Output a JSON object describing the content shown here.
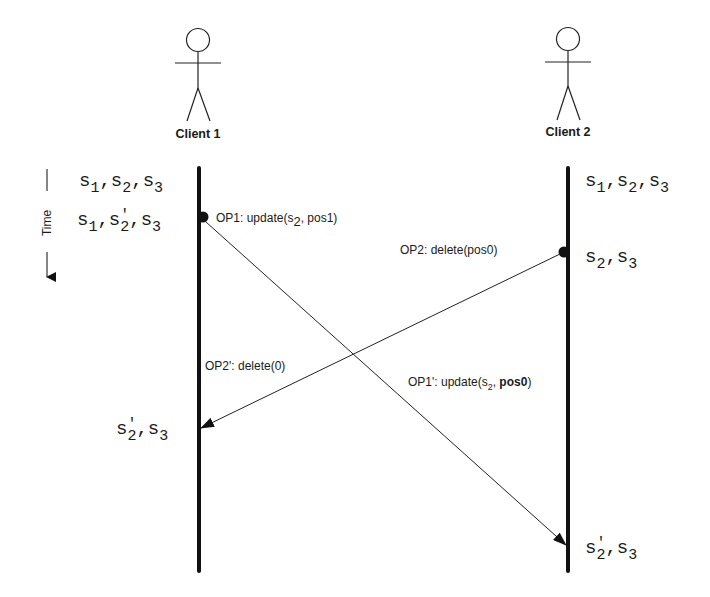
{
  "diagram": {
    "type": "sequence-diagram",
    "time_axis": {
      "label": "Time",
      "direction": "down"
    },
    "actors": [
      {
        "name": "Client 1",
        "x": 199
      },
      {
        "name": "Client 2",
        "x": 568
      }
    ],
    "client1": {
      "name": "Client 1",
      "states": [
        {
          "base": [
            "s",
            "s",
            "s"
          ],
          "subs": [
            "1",
            "2",
            "3"
          ],
          "primes": [
            "",
            "",
            ""
          ],
          "text": "s1,s2,s3"
        },
        {
          "base": [
            "s",
            "s",
            "s"
          ],
          "subs": [
            "1",
            "2",
            "3"
          ],
          "primes": [
            "",
            "'",
            ""
          ],
          "text": "s1,s'2,s3"
        },
        {
          "base": [
            "s",
            "s"
          ],
          "subs": [
            "2",
            "3"
          ],
          "primes": [
            "'",
            ""
          ],
          "text": "s'2,s3"
        }
      ]
    },
    "client2": {
      "name": "Client 2",
      "states": [
        {
          "text": "s1,s2,s3"
        },
        {
          "text": "s2,s3"
        },
        {
          "text": "s'2,s3"
        }
      ]
    },
    "messages": [
      {
        "id": "OP1",
        "from": "Client 1",
        "label_prefix": "OP1: update(s",
        "label_sub": "2",
        "label_suffix": ", pos1)"
      },
      {
        "id": "OP2",
        "from": "Client 2",
        "label": "OP2: delete(pos0)"
      },
      {
        "id": "OP2'",
        "to": "Client 1",
        "label": "OP2': delete(0)"
      },
      {
        "id": "OP1'",
        "to": "Client 2",
        "label_prefix": "OP1': update(s",
        "label_sub": "2",
        "label_mid": ", ",
        "label_bold": "pos0",
        "label_suffix": ")"
      }
    ]
  },
  "labels": {
    "client1": "Client 1",
    "client2": "Client 2",
    "time": "Time",
    "op1_prefix": "OP1: update(s",
    "op1_sub": "2",
    "op1_suffix": ", pos1)",
    "op2": "OP2: delete(pos0)",
    "op2p": "OP2': delete(0)",
    "op1p_prefix": "OP1': update(s",
    "op1p_sub": "2",
    "op1p_mid": ", ",
    "op1p_bold": "pos0",
    "op1p_suffix": ")",
    "s": "s",
    "comma": ",",
    "prime": "'",
    "n1": "1",
    "n2": "2",
    "n3": "3"
  }
}
